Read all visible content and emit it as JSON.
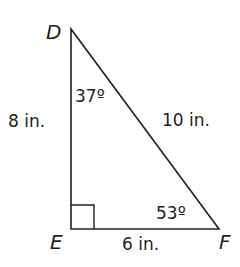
{
  "figure": {
    "type": "right-triangle",
    "stroke_color": "#231f20",
    "vertices": {
      "D": {
        "label": "D"
      },
      "E": {
        "label": "E"
      },
      "F": {
        "label": "F"
      }
    },
    "sides": {
      "DE": {
        "label": "8 in."
      },
      "EF": {
        "label": "6 in."
      },
      "DF": {
        "label": "10 in."
      }
    },
    "angles": {
      "D": {
        "label": "37º"
      },
      "F": {
        "label": "53º"
      },
      "E": {
        "label": "right-angle"
      }
    }
  }
}
